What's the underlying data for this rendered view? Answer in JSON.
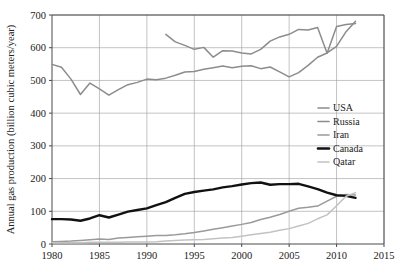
{
  "chart_data": {
    "type": "line",
    "title": "",
    "xlabel": "",
    "ylabel": "Annual gas production (billion cubic meters/year)",
    "xlim": [
      1980,
      2015
    ],
    "ylim": [
      0,
      700
    ],
    "xticks": [
      1980,
      1985,
      1990,
      1995,
      2000,
      2005,
      2010,
      2015
    ],
    "yticks": [
      0,
      100,
      200,
      300,
      400,
      500,
      600,
      700
    ],
    "grid": true,
    "legend_position": "center-right",
    "series": [
      {
        "name": "USA",
        "color": "#8c8c8c",
        "x": [
          1980,
          1981,
          1982,
          1983,
          1984,
          1985,
          1986,
          1987,
          1988,
          1989,
          1990,
          1991,
          1992,
          1993,
          1994,
          1995,
          1996,
          1997,
          1998,
          1999,
          2000,
          2001,
          2002,
          2003,
          2004,
          2005,
          2006,
          2007,
          2008,
          2009,
          2010,
          2011,
          2012
        ],
        "values": [
          549,
          540,
          504,
          457,
          492,
          474,
          455,
          472,
          487,
          494,
          504,
          502,
          507,
          516,
          526,
          527,
          534,
          539,
          544,
          539,
          543,
          545,
          536,
          541,
          526,
          511,
          524,
          546,
          571,
          584,
          604,
          649,
          681
        ]
      },
      {
        "name": "Russia",
        "color": "#8c8c8c",
        "x": [
          1992,
          1993,
          1994,
          1995,
          1996,
          1997,
          1998,
          1999,
          2000,
          2001,
          2002,
          2003,
          2004,
          2005,
          2006,
          2007,
          2008,
          2009,
          2010,
          2011,
          2012
        ],
        "values": [
          641,
          618,
          607,
          595,
          601,
          571,
          591,
          590,
          584,
          581,
          595,
          620,
          633,
          641,
          656,
          654,
          662,
          583,
          665,
          671,
          674
        ]
      },
      {
        "name": "Iran",
        "color": "#9a9a9a",
        "x": [
          1980,
          1981,
          1982,
          1983,
          1984,
          1985,
          1986,
          1987,
          1988,
          1989,
          1990,
          1991,
          1992,
          1993,
          1994,
          1995,
          1996,
          1997,
          1998,
          1999,
          2000,
          2001,
          2002,
          2003,
          2004,
          2005,
          2006,
          2007,
          2008,
          2009,
          2010,
          2011,
          2012
        ],
        "values": [
          7,
          8,
          9,
          11,
          13,
          15,
          14,
          18,
          20,
          22,
          24,
          26,
          26,
          28,
          31,
          35,
          40,
          45,
          50,
          55,
          60,
          66,
          75,
          82,
          90,
          100,
          109,
          112,
          116,
          131,
          146,
          151,
          150
        ]
      },
      {
        "name": "Canada",
        "color": "#111111",
        "x": [
          1980,
          1981,
          1982,
          1983,
          1984,
          1985,
          1986,
          1987,
          1988,
          1989,
          1990,
          1991,
          1992,
          1993,
          1994,
          1995,
          1996,
          1997,
          1998,
          1999,
          2000,
          2001,
          2002,
          2003,
          2004,
          2005,
          2006,
          2007,
          2008,
          2009,
          2010,
          2011,
          2012
        ],
        "values": [
          76,
          76,
          75,
          71,
          78,
          88,
          81,
          90,
          99,
          104,
          109,
          119,
          128,
          141,
          153,
          159,
          163,
          167,
          173,
          177,
          182,
          186,
          188,
          181,
          183,
          183,
          184,
          176,
          168,
          157,
          149,
          147,
          141
        ]
      },
      {
        "name": "Qatar",
        "color": "#c2c2c2",
        "x": [
          1980,
          1981,
          1982,
          1983,
          1984,
          1985,
          1986,
          1987,
          1988,
          1989,
          1990,
          1991,
          1992,
          1993,
          1994,
          1995,
          1996,
          1997,
          1998,
          1999,
          2000,
          2001,
          2002,
          2003,
          2004,
          2005,
          2006,
          2007,
          2008,
          2009,
          2010,
          2011,
          2012
        ],
        "values": [
          4,
          4,
          4,
          4,
          5,
          5,
          5,
          5,
          6,
          6,
          6,
          7,
          9,
          11,
          12,
          13,
          14,
          16,
          18,
          20,
          24,
          28,
          32,
          36,
          42,
          47,
          55,
          63,
          77,
          89,
          117,
          146,
          157
        ]
      }
    ],
    "legend": [
      {
        "label": "USA",
        "color": "#8c8c8c",
        "width": 1.6
      },
      {
        "label": "Russia",
        "color": "#8c8c8c",
        "width": 1.6
      },
      {
        "label": "Iran",
        "color": "#9a9a9a",
        "width": 1.6
      },
      {
        "label": "Canada",
        "color": "#111111",
        "width": 2.6
      },
      {
        "label": "Qatar",
        "color": "#c2c2c2",
        "width": 1.6
      }
    ],
    "style": {
      "grid_color": "#9b9b9b",
      "axis_color": "#4a4a4a",
      "background": "#ffffff"
    }
  }
}
